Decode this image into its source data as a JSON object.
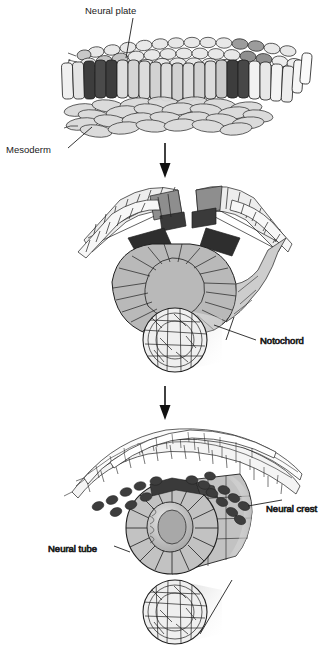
{
  "figure": {
    "title_visible": false,
    "background_color": "#ffffff",
    "line_color": "#1a1a1a",
    "stage_count": 3
  },
  "labels": {
    "neural_plate": "Neural plate",
    "mesoderm": "Mesoderm",
    "notochord": "Notochord",
    "neural_crest": "Neural crest",
    "neural_tube": "Neural tube"
  },
  "stages": [
    {
      "name": "stage-1-neural-plate",
      "labels": [
        "Neural plate",
        "Mesoderm"
      ],
      "structures": [
        "ectoderm-epithelium-sheet",
        "neural-plate-region",
        "mesoderm-layer"
      ]
    },
    {
      "name": "stage-2-neural-fold",
      "labels": [
        "Notochord"
      ],
      "structures": [
        "neural-folds",
        "neural-groove",
        "notochord-cylinder"
      ]
    },
    {
      "name": "stage-3-neural-tube",
      "labels": [
        "Neural crest",
        "Neural tube"
      ],
      "structures": [
        "overlying-ectoderm",
        "neural-crest-cells",
        "neural-tube-cylinder",
        "notochord-cylinder"
      ]
    }
  ],
  "arrows": [
    {
      "name": "arrow-stage1-to-stage2",
      "direction": "down"
    },
    {
      "name": "arrow-stage2-to-stage3",
      "direction": "down"
    }
  ],
  "palette": {
    "cell_light": "#f2f2f2",
    "cell_midlight": "#d9d9d9",
    "cell_mid": "#b8b8b8",
    "cell_dark": "#6e6e6e",
    "cell_darkest": "#3b3b3b",
    "crest_cell": "#3d3d3d",
    "outline": "#1f1f1f",
    "text": "#1a1a1a"
  }
}
